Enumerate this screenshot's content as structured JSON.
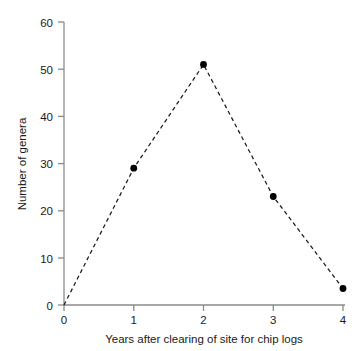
{
  "chart_data": {
    "type": "line",
    "title": "",
    "subtitle": "",
    "xlabel": "Years after clearing of site for chip logs",
    "ylabel": "Number of genera",
    "x": [
      0,
      1,
      2,
      3,
      4
    ],
    "values": [
      0,
      29,
      51,
      23,
      3.5
    ],
    "series": [
      {
        "name": "Number of genera",
        "values": [
          0,
          29,
          51,
          23,
          3.5
        ]
      }
    ],
    "xlim": [
      0,
      4
    ],
    "ylim": [
      0,
      60
    ],
    "xticks": [
      "0",
      "1",
      "2",
      "3",
      "4"
    ],
    "yticks": [
      "0",
      "10",
      "20",
      "30",
      "40",
      "50",
      "60"
    ],
    "grid": false,
    "legend": false,
    "legend_position": "none",
    "line_style": "dashed",
    "marker": "filled-circle",
    "line_color": "#1a1a1a",
    "marker_color": "#000000",
    "axis_color": "#808080",
    "background_color": "#ffffff",
    "annotations": []
  }
}
